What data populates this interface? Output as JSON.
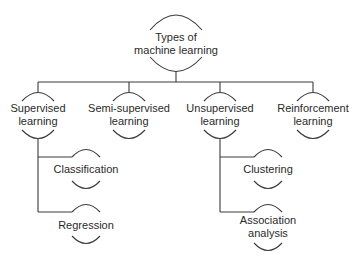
{
  "diagram": {
    "type": "tree",
    "stroke_color": "#3a3a3a",
    "root": {
      "label_line1": "Types of",
      "label_line2": "machine learning"
    },
    "level1": [
      {
        "label_line1": "Supervised",
        "label_line2": "learning"
      },
      {
        "label_line1": "Semi-supervised",
        "label_line2": "learning"
      },
      {
        "label_line1": "Unsupervised",
        "label_line2": "learning"
      },
      {
        "label_line1": "Reinforcement",
        "label_line2": "learning"
      }
    ],
    "supervised_children": [
      {
        "label_line1": "Classification",
        "label_line2": ""
      },
      {
        "label_line1": "Regression",
        "label_line2": ""
      }
    ],
    "unsupervised_children": [
      {
        "label_line1": "Clustering",
        "label_line2": ""
      },
      {
        "label_line1": "Association",
        "label_line2": "analysis"
      }
    ]
  }
}
